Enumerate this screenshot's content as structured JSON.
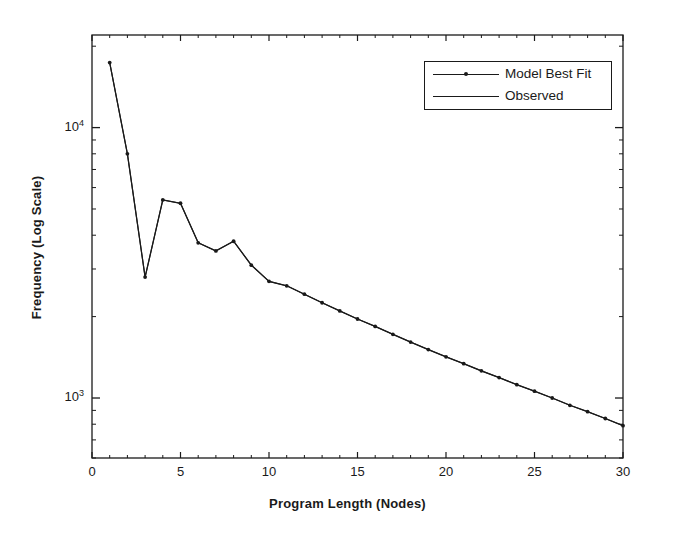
{
  "chart_data": {
    "type": "line",
    "title": "",
    "xlabel": "Program Length (Nodes)",
    "ylabel": "Frequency (Log Scale)",
    "yscale": "log",
    "xlim": [
      0,
      30
    ],
    "ylim": [
      600,
      22000
    ],
    "grid": false,
    "legend_position": "upper right",
    "xticks": [
      0,
      5,
      10,
      15,
      20,
      25,
      30
    ],
    "xtick_labels": [
      "0",
      "5",
      "10",
      "15",
      "20",
      "25",
      "30"
    ],
    "yticks": [
      1000,
      10000
    ],
    "ytick_labels": [
      "10^3",
      "10^4"
    ],
    "ytick_mantissa": [
      "10",
      "10"
    ],
    "ytick_exponent": [
      "3",
      "4"
    ],
    "series": [
      {
        "name": "Model Best Fit",
        "marker": "dot",
        "has_marker": true,
        "x": [
          1,
          2,
          3,
          4,
          5,
          6,
          7,
          8,
          9,
          10,
          11,
          12,
          13,
          14,
          15,
          16,
          17,
          18,
          19,
          20,
          21,
          22,
          23,
          24,
          25,
          26,
          27,
          28,
          29,
          30
        ],
        "values": [
          17400,
          8000,
          2800,
          5400,
          5250,
          3750,
          3500,
          3800,
          3100,
          2700,
          2600,
          2420,
          2250,
          2100,
          1960,
          1840,
          1720,
          1610,
          1510,
          1420,
          1340,
          1260,
          1190,
          1120,
          1060,
          1000,
          940,
          890,
          840,
          790
        ]
      },
      {
        "name": "Observed",
        "marker": "none",
        "has_marker": false,
        "x": [
          1,
          2,
          3,
          4,
          5,
          6,
          7,
          8,
          9,
          10,
          11,
          12,
          13,
          14,
          15,
          16,
          17,
          18,
          19,
          20,
          21,
          22,
          23,
          24,
          25,
          26,
          27,
          28,
          29,
          30
        ],
        "values": [
          17400,
          8000,
          2800,
          5400,
          5250,
          3750,
          3500,
          3800,
          3100,
          2700,
          2600,
          2420,
          2250,
          2100,
          1960,
          1840,
          1720,
          1610,
          1510,
          1420,
          1340,
          1260,
          1190,
          1120,
          1060,
          1000,
          940,
          890,
          840,
          790
        ]
      }
    ]
  },
  "legend": {
    "entries": [
      {
        "label": "Model Best Fit"
      },
      {
        "label": "Observed"
      }
    ]
  },
  "colors": {
    "line": "#1a1a1a",
    "axis": "#1a1a1a",
    "background": "#ffffff"
  }
}
